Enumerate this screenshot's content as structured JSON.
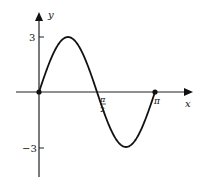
{
  "chart_data": {
    "type": "line",
    "title": "",
    "xlabel": "x",
    "ylabel": "y",
    "function": "y = 3 sin(2x)",
    "xlim": [
      0,
      3.1416
    ],
    "ylim": [
      -3,
      3
    ],
    "x_ticks": [
      {
        "value": 1.5708,
        "label_num": "π",
        "label_den": "2"
      },
      {
        "value": 3.1416,
        "label": "π"
      }
    ],
    "y_ticks": [
      {
        "value": 3,
        "label": "3"
      },
      {
        "value": -3,
        "label": "−3"
      }
    ],
    "series": [
      {
        "name": "3 sin 2x",
        "x": [
          0,
          0.3927,
          0.7854,
          1.1781,
          1.5708,
          1.9635,
          2.3562,
          2.7489,
          3.1416
        ],
        "values": [
          0,
          2.12,
          3,
          2.12,
          0,
          -2.12,
          -3,
          -2.12,
          0
        ]
      }
    ],
    "marked_points": [
      {
        "x": 0,
        "y": 0
      },
      {
        "x": 3.1416,
        "y": 0
      }
    ],
    "grid": false,
    "legend": null,
    "color": "#111111"
  }
}
